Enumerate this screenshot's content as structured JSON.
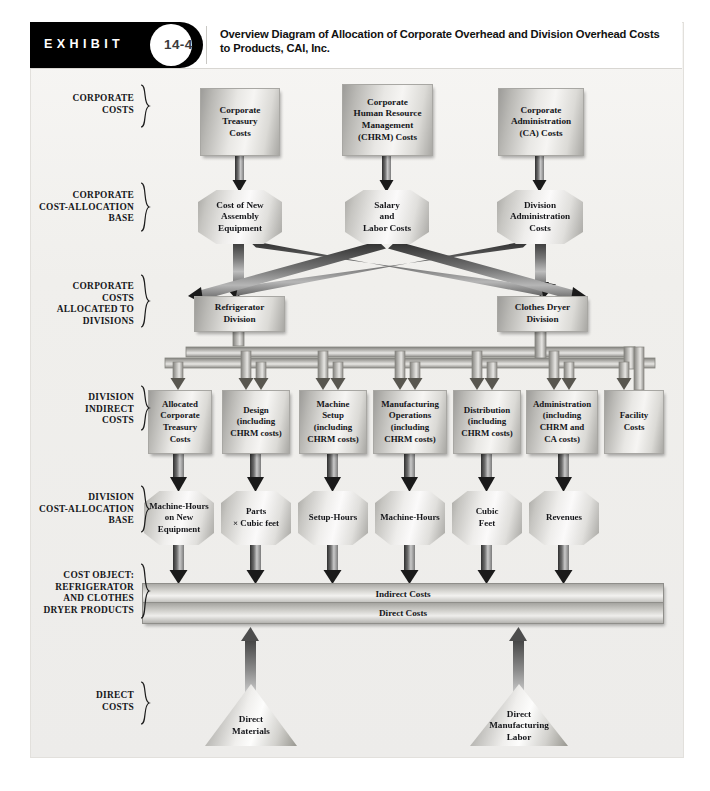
{
  "header": {
    "exhibit_label": "EXHIBIT",
    "exhibit_number": "14-4",
    "title": "Overview Diagram of Allocation of Corporate Overhead and Division Overhead Costs to Products, CAI, Inc."
  },
  "row_labels": [
    {
      "id": "corporate-costs",
      "text": "CORPORATE\nCOSTS"
    },
    {
      "id": "corporate-cost-allocation-base",
      "text": "CORPORATE\nCOST-ALLOCATION\nBASE"
    },
    {
      "id": "corporate-costs-allocated-to-divisions",
      "text": "CORPORATE\nCOSTS\nALLOCATED TO\nDIVISIONS"
    },
    {
      "id": "division-indirect-costs",
      "text": "DIVISION\nINDIRECT\nCOSTS"
    },
    {
      "id": "division-cost-allocation-base",
      "text": "DIVISION\nCOST-ALLOCATION\nBASE"
    },
    {
      "id": "cost-object",
      "text": "COST OBJECT:\nREFRIGERATOR\nAND CLOTHES\nDRYER PRODUCTS"
    },
    {
      "id": "direct-costs",
      "text": "DIRECT\nCOSTS"
    }
  ],
  "corporate_costs": [
    {
      "id": "corporate-treasury-costs",
      "text": "Corporate\nTreasury\nCosts"
    },
    {
      "id": "corporate-chrm-costs",
      "text": "Corporate\nHuman Resource\nManagement\n(CHRM) Costs"
    },
    {
      "id": "corporate-administration-costs",
      "text": "Corporate\nAdministration\n(CA) Costs"
    }
  ],
  "corporate_allocation_bases": [
    {
      "id": "cost-of-new-assembly-equipment",
      "text": "Cost of New\nAssembly\nEquipment"
    },
    {
      "id": "salary-and-labor-costs",
      "text": "Salary\nand\nLabor Costs"
    },
    {
      "id": "division-administration-costs",
      "text": "Division\nAdministration\nCosts"
    }
  ],
  "divisions": [
    {
      "id": "refrigerator-division",
      "text": "Refrigerator\nDivision"
    },
    {
      "id": "clothes-dryer-division",
      "text": "Clothes Dryer\nDivision"
    }
  ],
  "division_indirect_costs": [
    {
      "id": "allocated-corporate-treasury-costs",
      "text": "Allocated\nCorporate\nTreasury\nCosts"
    },
    {
      "id": "design",
      "text": "Design\n(including\nCHRM costs)"
    },
    {
      "id": "machine-setup",
      "text": "Machine\nSetup\n(including\nCHRM costs)"
    },
    {
      "id": "manufacturing-operations",
      "text": "Manufacturing\nOperations\n(including\nCHRM costs)"
    },
    {
      "id": "distribution",
      "text": "Distribution\n(including\nCHRM costs)"
    },
    {
      "id": "administration",
      "text": "Administration\n(including\nCHRM and\nCA costs)"
    },
    {
      "id": "facility-costs",
      "text": "Facility\nCosts"
    }
  ],
  "division_allocation_bases": [
    {
      "id": "machine-hours-on-new-equipment",
      "text": "Machine-Hours\non New\nEquipment"
    },
    {
      "id": "parts-x-cubic-feet",
      "text": "Parts\n× Cubic feet"
    },
    {
      "id": "setup-hours",
      "text": "Setup-Hours"
    },
    {
      "id": "machine-hours",
      "text": "Machine-Hours"
    },
    {
      "id": "cubic-feet",
      "text": "Cubic\nFeet"
    },
    {
      "id": "revenues",
      "text": "Revenues"
    }
  ],
  "cost_object_bars": [
    {
      "id": "indirect-costs-bar",
      "text": "Indirect Costs"
    },
    {
      "id": "direct-costs-bar",
      "text": "Direct Costs"
    }
  ],
  "direct_cost_items": [
    {
      "id": "direct-materials",
      "text": "Direct\nMaterials"
    },
    {
      "id": "direct-manufacturing-labor",
      "text": "Direct\nManufacturing\nLabor"
    }
  ],
  "colors": {
    "header_bar": "#000000",
    "panel_background": "#f2f1ee",
    "shape_fill_light": "#f6f5f3",
    "shape_fill_dark": "#9d9c99",
    "arrow": "#1d1d1d",
    "text": "#15161a"
  }
}
